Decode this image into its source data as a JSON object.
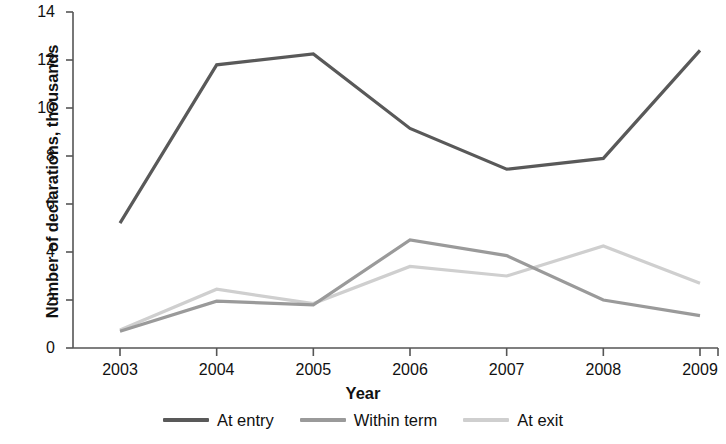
{
  "chart_data": {
    "type": "line",
    "title": "",
    "xlabel": "Year",
    "ylabel": "Number of declarations, thousands",
    "x": [
      2003,
      2004,
      2005,
      2006,
      2007,
      2008,
      2009
    ],
    "categories": [
      "2003",
      "2004",
      "2005",
      "2006",
      "2007",
      "2008",
      "2009"
    ],
    "xlim": [
      2003,
      2009
    ],
    "ylim": [
      0,
      14
    ],
    "yticks": [
      0,
      2,
      4,
      6,
      8,
      10,
      12,
      14
    ],
    "ytick_labels": [
      "0",
      "2",
      "4",
      "6",
      "8",
      "10",
      "12",
      "14"
    ],
    "grid": false,
    "legend_position": "bottom",
    "series": [
      {
        "name": "At entry",
        "color": "#595959",
        "values": [
          5.2,
          11.8,
          12.25,
          9.15,
          7.45,
          7.9,
          12.4
        ]
      },
      {
        "name": "Within term",
        "color": "#9a9a9a",
        "values": [
          0.7,
          1.95,
          1.8,
          4.5,
          3.85,
          2.0,
          1.35
        ]
      },
      {
        "name": "At exit",
        "color": "#cfcfcf",
        "values": [
          0.75,
          2.45,
          1.85,
          3.4,
          3.0,
          4.25,
          2.7
        ]
      }
    ]
  },
  "axis": {
    "spine_color": "#555555"
  }
}
